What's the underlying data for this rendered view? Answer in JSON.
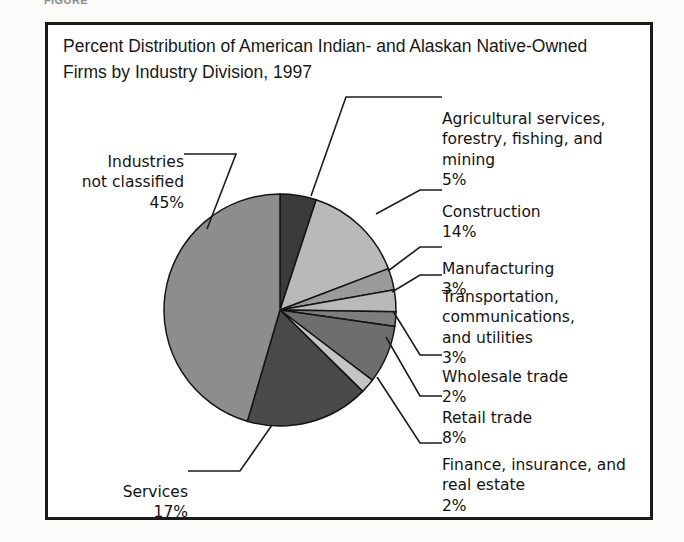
{
  "figure": {
    "caption_cut": "FIGURE",
    "title": "Percent Distribution of American Indian- and Alaskan Native-Owned\nFirms by Industry Division, 1997",
    "frame_color": "#1a1a1a"
  },
  "chart_data": {
    "type": "pie",
    "title": "Percent Distribution of American Indian- and Alaskan Native-Owned Firms by Industry Division, 1997",
    "xlabel": "",
    "ylabel": "",
    "unit": "percent",
    "legend_position": "callout-labels",
    "grid": false,
    "categories": [
      "Agricultural services, forestry, fishing, and mining",
      "Construction",
      "Manufacturing",
      "Transportation, communications, and utilities",
      "Wholesale trade",
      "Retail trade",
      "Finance, insurance, and real estate",
      "Services",
      "Industries not classified"
    ],
    "values": [
      5,
      14,
      3,
      3,
      2,
      8,
      2,
      17,
      45
    ],
    "value_labels": [
      "5%",
      "14%",
      "3%",
      "3%",
      "2%",
      "8%",
      "2%",
      "17%",
      "45%"
    ],
    "colors": [
      "#3b3b3b",
      "#b9b9b9",
      "#9a9a9a",
      "#b9b9b9",
      "#7e7e7e",
      "#6e6e6e",
      "#c4c4c4",
      "#4a4a4a",
      "#8d8d8d"
    ],
    "start_angle_deg": 0,
    "direction": "clockwise",
    "total": 99
  },
  "slice_labels": [
    {
      "key": "agricultural",
      "name": "Agricultural services,\nforestry, fishing, and\nmining",
      "pct": "5%"
    },
    {
      "key": "construction",
      "name": "Construction",
      "pct": "14%"
    },
    {
      "key": "manufacturing",
      "name": "Manufacturing",
      "pct": "3%"
    },
    {
      "key": "transportation",
      "name": "Transportation,\ncommunications,\nand utilities",
      "pct": "3%"
    },
    {
      "key": "wholesale",
      "name": "Wholesale trade",
      "pct": "2%"
    },
    {
      "key": "retail",
      "name": "Retail trade",
      "pct": "8%"
    },
    {
      "key": "finance",
      "name": "Finance, insurance, and\nreal estate",
      "pct": "2%"
    },
    {
      "key": "services",
      "name": "Services",
      "pct": "17%"
    },
    {
      "key": "not-classified",
      "name": "Industries\nnot classified",
      "pct": "45%"
    }
  ]
}
